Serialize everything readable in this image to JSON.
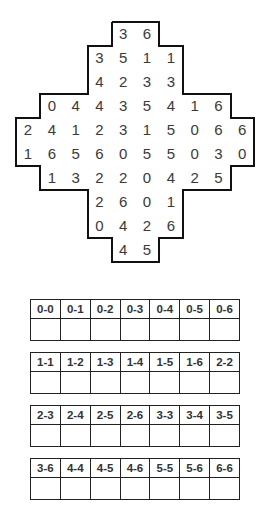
{
  "puzzle": {
    "rows": [
      {
        "start": 5,
        "values": [
          "3",
          "6"
        ]
      },
      {
        "start": 4,
        "values": [
          "3",
          "5",
          "1",
          "1"
        ]
      },
      {
        "start": 4,
        "values": [
          "4",
          "2",
          "3",
          "3"
        ]
      },
      {
        "start": 2,
        "values": [
          "0",
          "4",
          "4",
          "3",
          "5",
          "4",
          "1",
          "6"
        ]
      },
      {
        "start": 1,
        "values": [
          "2",
          "4",
          "1",
          "2",
          "3",
          "1",
          "5",
          "0",
          "6",
          "6"
        ]
      },
      {
        "start": 1,
        "values": [
          "1",
          "6",
          "5",
          "6",
          "0",
          "5",
          "5",
          "0",
          "3",
          "0"
        ]
      },
      {
        "start": 2,
        "values": [
          "1",
          "3",
          "2",
          "2",
          "0",
          "4",
          "2",
          "5"
        ]
      },
      {
        "start": 4,
        "values": [
          "2",
          "6",
          "0",
          "1"
        ]
      },
      {
        "start": 4,
        "values": [
          "0",
          "4",
          "2",
          "6"
        ]
      },
      {
        "start": 5,
        "values": [
          "4",
          "5"
        ]
      }
    ]
  },
  "domino_tables": [
    {
      "labels": [
        "0-0",
        "0-1",
        "0-2",
        "0-3",
        "0-4",
        "0-5",
        "0-6"
      ],
      "answers": [
        "",
        "",
        "",
        "",
        "",
        "",
        ""
      ]
    },
    {
      "labels": [
        "1-1",
        "1-2",
        "1-3",
        "1-4",
        "1-5",
        "1-6",
        "2-2"
      ],
      "answers": [
        "",
        "",
        "",
        "",
        "",
        "",
        ""
      ]
    },
    {
      "labels": [
        "2-3",
        "2-4",
        "2-5",
        "2-6",
        "3-3",
        "3-4",
        "3-5"
      ],
      "answers": [
        "",
        "",
        "",
        "",
        "",
        "",
        ""
      ]
    },
    {
      "labels": [
        "3-6",
        "4-4",
        "4-5",
        "4-6",
        "5-5",
        "5-6",
        "6-6"
      ],
      "answers": [
        "",
        "",
        "",
        "",
        "",
        "",
        ""
      ]
    }
  ]
}
